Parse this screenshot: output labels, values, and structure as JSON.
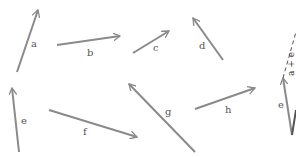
{
  "diagram": {
    "title": "",
    "colors": {
      "arrow": "#8a8a8a",
      "dark_line": "#555555",
      "label": "#555555",
      "background": "#ffffff"
    },
    "vectors": [
      {
        "id": "a",
        "label": "a",
        "x1": 17,
        "y1": 72,
        "x2": 38,
        "y2": 10,
        "lx": 31,
        "ly": 39
      },
      {
        "id": "b",
        "label": "b",
        "x1": 57,
        "y1": 45,
        "x2": 120,
        "y2": 36,
        "lx": 87,
        "ly": 48
      },
      {
        "id": "c",
        "label": "c",
        "x1": 133,
        "y1": 53,
        "x2": 169,
        "y2": 31,
        "lx": 153,
        "ly": 43
      },
      {
        "id": "d",
        "label": "d",
        "x1": 223,
        "y1": 60,
        "x2": 193,
        "y2": 18,
        "lx": 199,
        "ly": 41
      },
      {
        "id": "e",
        "label": "e",
        "x1": 19,
        "y1": 152,
        "x2": 12,
        "y2": 88,
        "lx": 21,
        "ly": 116
      },
      {
        "id": "f",
        "label": "f",
        "x1": 49,
        "y1": 110,
        "x2": 137,
        "y2": 137,
        "lx": 83,
        "ly": 127
      },
      {
        "id": "g",
        "label": "g",
        "x1": 195,
        "y1": 152,
        "x2": 129,
        "y2": 84,
        "lx": 165,
        "ly": 107
      },
      {
        "id": "h",
        "label": "h",
        "x1": 195,
        "y1": 109,
        "x2": 255,
        "y2": 88,
        "lx": 225,
        "ly": 105
      }
    ],
    "partial_figure": {
      "e_label": "e",
      "sum_label": "a + e",
      "e_vector": {
        "x1": 292,
        "y1": 135,
        "x2": 283,
        "y2": 78
      },
      "dashed": {
        "x1": 283,
        "y1": 78,
        "x2": 296,
        "y2": 32
      },
      "dark": {
        "x1": 292,
        "y1": 135,
        "x2": 296,
        "y2": 110
      },
      "e_lx": 278,
      "e_ly": 100,
      "sum_lx": 286,
      "sum_ly": 76
    }
  }
}
